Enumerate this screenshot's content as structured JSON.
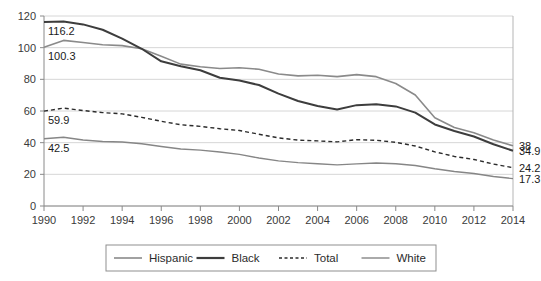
{
  "chart_data": {
    "type": "line",
    "title": "",
    "subtitle": "",
    "xlabel": "",
    "ylabel": "",
    "xlim": [
      1990,
      2014
    ],
    "ylim": [
      0,
      120
    ],
    "y_ticks": [
      0,
      20,
      40,
      60,
      80,
      100,
      120
    ],
    "x_ticks": [
      1990,
      1992,
      1994,
      1996,
      1998,
      2000,
      2002,
      2004,
      2006,
      2008,
      2010,
      2012,
      2014
    ],
    "grid": true,
    "legend_position": "bottom",
    "x": [
      1990,
      1991,
      1992,
      1993,
      1994,
      1995,
      1996,
      1997,
      1998,
      1999,
      2000,
      2001,
      2002,
      2003,
      2004,
      2005,
      2006,
      2007,
      2008,
      2009,
      2010,
      2011,
      2012,
      2013,
      2014
    ],
    "series": [
      {
        "name": "Hispanic",
        "color": "#8a8a8a",
        "width": 1.6,
        "dash": "none",
        "values": [
          100.3,
          104.6,
          103.3,
          101.8,
          101.3,
          99.3,
          94.6,
          89.6,
          87.9,
          86.8,
          87.3,
          86.4,
          83.4,
          82.2,
          82.6,
          81.7,
          83.0,
          81.7,
          77.4,
          70.1,
          55.7,
          49.6,
          46.3,
          41.7,
          38.0
        ]
      },
      {
        "name": "Black",
        "color": "#3d3d3d",
        "width": 2.0,
        "dash": "none",
        "values": [
          116.2,
          116.5,
          114.7,
          111.3,
          105.7,
          99.3,
          91.4,
          88.3,
          85.7,
          81.0,
          79.2,
          76.4,
          71.0,
          66.3,
          63.1,
          60.9,
          63.7,
          64.3,
          62.9,
          59.0,
          51.5,
          47.4,
          43.9,
          39.0,
          34.9
        ]
      },
      {
        "name": "Total",
        "color": "#2b2b2b",
        "width": 1.4,
        "dash": "4,3",
        "values": [
          59.9,
          61.8,
          60.3,
          59.0,
          58.2,
          56.0,
          53.5,
          51.3,
          50.3,
          48.8,
          47.7,
          45.3,
          43.0,
          41.6,
          41.1,
          40.5,
          41.9,
          41.5,
          40.2,
          37.9,
          34.2,
          31.3,
          29.4,
          26.5,
          24.2
        ]
      },
      {
        "name": "White",
        "color": "#868686",
        "width": 1.4,
        "dash": "none",
        "values": [
          42.5,
          43.4,
          41.7,
          40.7,
          40.4,
          39.3,
          37.6,
          36.0,
          35.3,
          34.1,
          32.6,
          30.3,
          28.5,
          27.4,
          26.7,
          26.0,
          26.6,
          27.2,
          26.7,
          25.6,
          23.5,
          21.8,
          20.5,
          18.6,
          17.3
        ]
      }
    ],
    "start_labels": [
      {
        "series": "Black",
        "value": "116.2",
        "year": 1990
      },
      {
        "series": "Hispanic",
        "value": "100.3",
        "year": 1990
      },
      {
        "series": "Total",
        "value": "59.9",
        "year": 1990
      },
      {
        "series": "White",
        "value": "42.5",
        "year": 1990
      }
    ],
    "end_labels": [
      {
        "series": "Hispanic",
        "value": "38",
        "year": 2014
      },
      {
        "series": "Black",
        "value": "34.9",
        "year": 2014
      },
      {
        "series": "Total",
        "value": "24.2",
        "year": 2014
      },
      {
        "series": "White",
        "value": "17.3",
        "year": 2014
      }
    ]
  },
  "legend": {
    "entries": [
      {
        "label": "Hispanic",
        "color": "#8a8a8a",
        "dash": "none",
        "width": 1.6
      },
      {
        "label": "Black",
        "color": "#3d3d3d",
        "dash": "none",
        "width": 2.2
      },
      {
        "label": "Total",
        "color": "#2b2b2b",
        "dash": "3,2.5",
        "width": 1.4
      },
      {
        "label": "White",
        "color": "#868686",
        "dash": "none",
        "width": 1.4
      }
    ]
  }
}
